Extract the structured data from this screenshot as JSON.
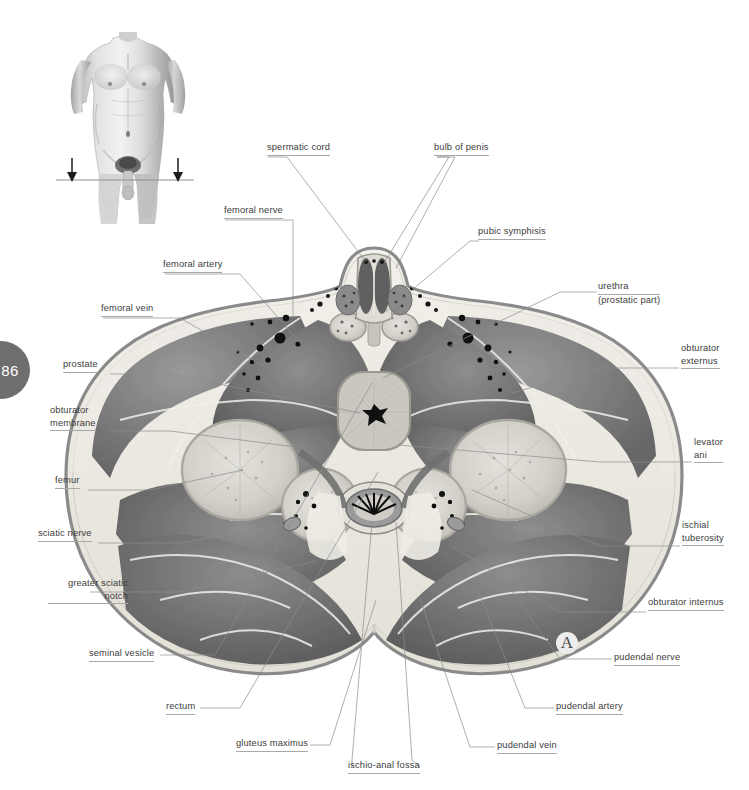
{
  "page": {
    "number": "86",
    "marker": "A"
  },
  "figure": {
    "orientation_inset": "male torso with section plane",
    "section_plane_arrows": 2
  },
  "colors": {
    "page_badge_bg": "#6e6e6e",
    "page_badge_text": "#ffffff",
    "label_text": "#3c3c3c",
    "leader_line": "#8d8d8d",
    "underline": "#a8a8a8",
    "skin_line": "#8a8a8a",
    "fat": "#eceae4",
    "muscle_dark": "#6b6b6b",
    "muscle_mid": "#878787",
    "bone_trabecular": "#d8d6d0",
    "vessel_black": "#1a1a1a",
    "marker_halo": "#ececec"
  },
  "labels": [
    {
      "id": "spermatic-cord",
      "lines": [
        "spermatic cord"
      ],
      "underline": [
        true
      ],
      "align": "left",
      "x": 267,
      "y": 142
    },
    {
      "id": "bulb-of-penis",
      "lines": [
        "bulb of penis"
      ],
      "underline": [
        true
      ],
      "align": "left",
      "x": 434,
      "y": 142
    },
    {
      "id": "femoral-nerve",
      "lines": [
        "femoral nerve"
      ],
      "underline": [
        true
      ],
      "align": "left",
      "x": 224,
      "y": 205
    },
    {
      "id": "pubic-symphisis",
      "lines": [
        "pubic symphisis"
      ],
      "underline": [
        true
      ],
      "align": "left",
      "x": 478,
      "y": 226
    },
    {
      "id": "femoral-artery",
      "lines": [
        "femoral artery"
      ],
      "underline": [
        true
      ],
      "align": "left",
      "x": 163,
      "y": 259
    },
    {
      "id": "urethra",
      "lines": [
        "urethra",
        "(prostatic part)"
      ],
      "underline": [
        true,
        false
      ],
      "align": "left",
      "x": 598,
      "y": 281
    },
    {
      "id": "femoral-vein",
      "lines": [
        "femoral vein"
      ],
      "underline": [
        true
      ],
      "align": "left",
      "x": 101,
      "y": 303
    },
    {
      "id": "obturator-externus",
      "lines": [
        "obturator",
        "externus"
      ],
      "underline": [
        false,
        true
      ],
      "align": "left",
      "x": 681,
      "y": 343
    },
    {
      "id": "prostate",
      "lines": [
        "prostate"
      ],
      "underline": [
        true
      ],
      "align": "left",
      "x": 63,
      "y": 359
    },
    {
      "id": "obturator-membrane",
      "lines": [
        "obturator",
        "membrane"
      ],
      "underline": [
        false,
        true
      ],
      "align": "left",
      "x": 50,
      "y": 405
    },
    {
      "id": "levator-ani",
      "lines": [
        "levator",
        "ani"
      ],
      "underline": [
        false,
        true
      ],
      "align": "left",
      "x": 694,
      "y": 437
    },
    {
      "id": "femur",
      "lines": [
        "femur"
      ],
      "underline": [
        true
      ],
      "align": "left",
      "x": 55,
      "y": 475
    },
    {
      "id": "ischial-tuberosity",
      "lines": [
        "ischial",
        "tuberosity"
      ],
      "underline": [
        false,
        true
      ],
      "align": "left",
      "x": 682,
      "y": 520
    },
    {
      "id": "sciatic-nerve",
      "lines": [
        "sciatic nerve"
      ],
      "underline": [
        true
      ],
      "align": "left",
      "x": 38,
      "y": 528
    },
    {
      "id": "greater-sciatic-notch",
      "lines": [
        "greater sciatic",
        "notch"
      ],
      "underline": [
        false,
        true
      ],
      "align": "right",
      "x": 48,
      "y": 578,
      "w": 80
    },
    {
      "id": "obturator-internus",
      "lines": [
        "obturator internus"
      ],
      "underline": [
        true
      ],
      "align": "left",
      "x": 648,
      "y": 597
    },
    {
      "id": "seminal-vesicle",
      "lines": [
        "seminal vesicle"
      ],
      "underline": [
        true
      ],
      "align": "left",
      "x": 89,
      "y": 648
    },
    {
      "id": "pudendal-nerve",
      "lines": [
        "pudendal nerve"
      ],
      "underline": [
        true
      ],
      "align": "left",
      "x": 614,
      "y": 652
    },
    {
      "id": "rectum",
      "lines": [
        "rectum"
      ],
      "underline": [
        true
      ],
      "align": "left",
      "x": 166,
      "y": 701
    },
    {
      "id": "pudendal-artery",
      "lines": [
        "pudendal artery"
      ],
      "underline": [
        true
      ],
      "align": "left",
      "x": 556,
      "y": 701
    },
    {
      "id": "gluteus-maximus",
      "lines": [
        "gluteus maximus"
      ],
      "underline": [
        true
      ],
      "align": "left",
      "x": 236,
      "y": 738
    },
    {
      "id": "pudendal-vein",
      "lines": [
        "pudendal vein"
      ],
      "underline": [
        true
      ],
      "align": "left",
      "x": 497,
      "y": 740
    },
    {
      "id": "ischio-anal-fossa",
      "lines": [
        "ischio-anal fossa"
      ],
      "underline": [
        true
      ],
      "align": "left",
      "x": 348,
      "y": 760
    }
  ],
  "leaders": [
    {
      "id": "spermatic-cord",
      "pts": "[[268,157],[287,157],[366,262]]"
    },
    {
      "id": "bulb-of-penis-a",
      "pts": "[[437,157],[449,157],[384,263]]"
    },
    {
      "id": "bulb-of-penis-b",
      "pts": "[[437,157],[455,157],[396,268]]"
    },
    {
      "id": "femoral-nerve",
      "pts": "[[225,220],[293,220],[293,316]]"
    },
    {
      "id": "pubic-symphisis",
      "pts": "[[479,241],[470,241],[386,312]]"
    },
    {
      "id": "femoral-artery",
      "pts": "[[165,274],[240,274],[308,352]]"
    },
    {
      "id": "urethra",
      "pts": "[[597,292],[560,292],[383,378]]"
    },
    {
      "id": "femoral-vein",
      "pts": "[[103,318],[180,318],[272,371]]"
    },
    {
      "id": "obturator-externus",
      "pts": "[[679,368],[600,368],[512,393]]"
    },
    {
      "id": "prostate",
      "pts": "[[110,374],[170,374],[360,413]]"
    },
    {
      "id": "obturator-membrane",
      "pts": "[[110,431],[170,431],[296,447]]"
    },
    {
      "id": "levator-ani",
      "pts": "[[692,462],[600,462],[399,445]]"
    },
    {
      "id": "femur",
      "pts": "[[88,490],[150,490],[243,470]]"
    },
    {
      "id": "ischial-tuberosity",
      "pts": "[[680,546],[600,546],[472,490]]"
    },
    {
      "id": "sciatic-nerve",
      "pts": "[[98,543],[180,543],[292,524]]"
    },
    {
      "id": "greater-sciatic-notch",
      "pts": "[[90,592],[180,592],[316,561]]"
    },
    {
      "id": "obturator-internus",
      "pts": "[[646,612],[560,612],[451,546]]"
    },
    {
      "id": "seminal-vesicle",
      "pts": "[[160,655],[215,655],[372,383]]"
    },
    {
      "id": "pudendal-nerve",
      "pts": "[[612,659],[560,659],[497,570]]"
    },
    {
      "id": "rectum",
      "pts": "[[200,708],[240,708],[378,472]]"
    },
    {
      "id": "pudendal-artery",
      "pts": "[[554,708],[525,708],[478,590]]"
    },
    {
      "id": "gluteus-maximus",
      "pts": "[[310,745],[330,745],[376,600]]"
    },
    {
      "id": "pudendal-vein",
      "pts": "[[495,747],[470,747],[420,598]]"
    },
    {
      "id": "ischio-anal-fossa-a",
      "pts": "[[352,767],[352,760],[372,522]]"
    },
    {
      "id": "ischio-anal-fossa-b",
      "pts": "[[420,767],[412,760],[396,522]]"
    }
  ]
}
